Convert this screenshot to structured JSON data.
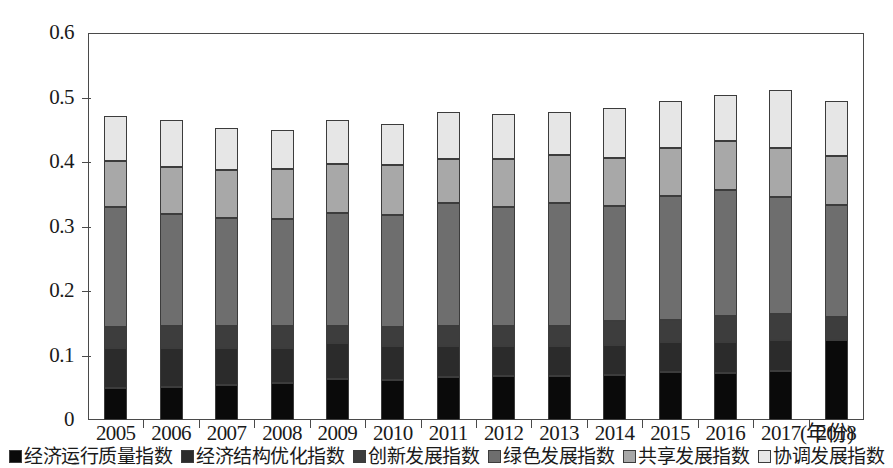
{
  "chart_data": {
    "type": "bar",
    "subtype": "stacked-bar",
    "title": "",
    "xlabel": "(年份)",
    "ylabel": "",
    "ylim": [
      0,
      0.6
    ],
    "ytick_labels": [
      "0",
      "0.1",
      "0.2",
      "0.3",
      "0.4",
      "0.5",
      "0.6"
    ],
    "ytick_values": [
      0,
      0.1,
      0.2,
      0.3,
      0.4,
      0.5,
      0.6
    ],
    "grid": false,
    "legend_position": "bottom",
    "categories": [
      "2005",
      "2006",
      "2007",
      "2008",
      "2009",
      "2010",
      "2011",
      "2012",
      "2013",
      "2014",
      "2015",
      "2016",
      "2017",
      "2018"
    ],
    "series": [
      {
        "name": "经济运行质量指数",
        "color": "#0a0a0a",
        "values": [
          0.05,
          0.051,
          0.054,
          0.057,
          0.064,
          0.062,
          0.066,
          0.068,
          0.068,
          0.07,
          0.074,
          0.073,
          0.076,
          0.124
        ]
      },
      {
        "name": "经济结构优化指数",
        "color": "#2b2b2b",
        "values": [
          0.061,
          0.06,
          0.057,
          0.055,
          0.055,
          0.053,
          0.049,
          0.047,
          0.047,
          0.046,
          0.047,
          0.048,
          0.048,
          0.0
        ]
      },
      {
        "name": "创新发展指数",
        "color": "#3d3d3d",
        "values": [
          0.033,
          0.034,
          0.034,
          0.033,
          0.026,
          0.029,
          0.031,
          0.03,
          0.031,
          0.037,
          0.034,
          0.04,
          0.041,
          0.036
        ]
      },
      {
        "name": "绿色发展指数",
        "color": "#6e6e6e",
        "values": [
          0.186,
          0.175,
          0.168,
          0.167,
          0.176,
          0.174,
          0.191,
          0.185,
          0.191,
          0.179,
          0.193,
          0.195,
          0.181,
          0.174
        ]
      },
      {
        "name": "共享发展指数",
        "color": "#a8a8a8",
        "values": [
          0.071,
          0.072,
          0.074,
          0.077,
          0.076,
          0.077,
          0.068,
          0.074,
          0.074,
          0.074,
          0.074,
          0.076,
          0.075,
          0.076
        ]
      },
      {
        "name": "协调发展指数",
        "color": "#e6e6e6",
        "values": [
          0.07,
          0.073,
          0.065,
          0.061,
          0.068,
          0.064,
          0.073,
          0.071,
          0.067,
          0.078,
          0.072,
          0.072,
          0.091,
          0.085
        ]
      }
    ],
    "totals": [
      0.471,
      0.465,
      0.452,
      0.45,
      0.465,
      0.459,
      0.478,
      0.475,
      0.478,
      0.484,
      0.494,
      0.504,
      0.512,
      0.495
    ]
  }
}
